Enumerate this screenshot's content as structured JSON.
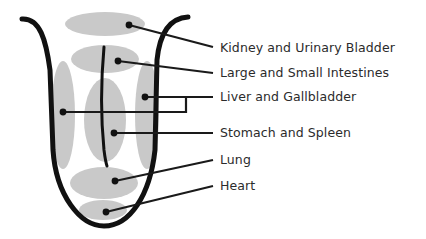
{
  "diagram": {
    "colors": {
      "outline": "#111111",
      "region": "#c9c9c9",
      "leader": "#1a1a1a",
      "text": "#2b2b2b"
    },
    "labels": [
      {
        "id": "kidney",
        "text": "Kidney and Urinary Bladder",
        "y": 42
      },
      {
        "id": "intestines",
        "text": "Large and Small Intestines",
        "y": 66
      },
      {
        "id": "liver",
        "text": "Liver and Gallbladder",
        "y": 90
      },
      {
        "id": "stomach",
        "text": "Stomach and Spleen",
        "y": 125
      },
      {
        "id": "lung",
        "text": "Lung",
        "y": 153
      },
      {
        "id": "heart",
        "text": "Heart",
        "y": 179
      }
    ]
  }
}
